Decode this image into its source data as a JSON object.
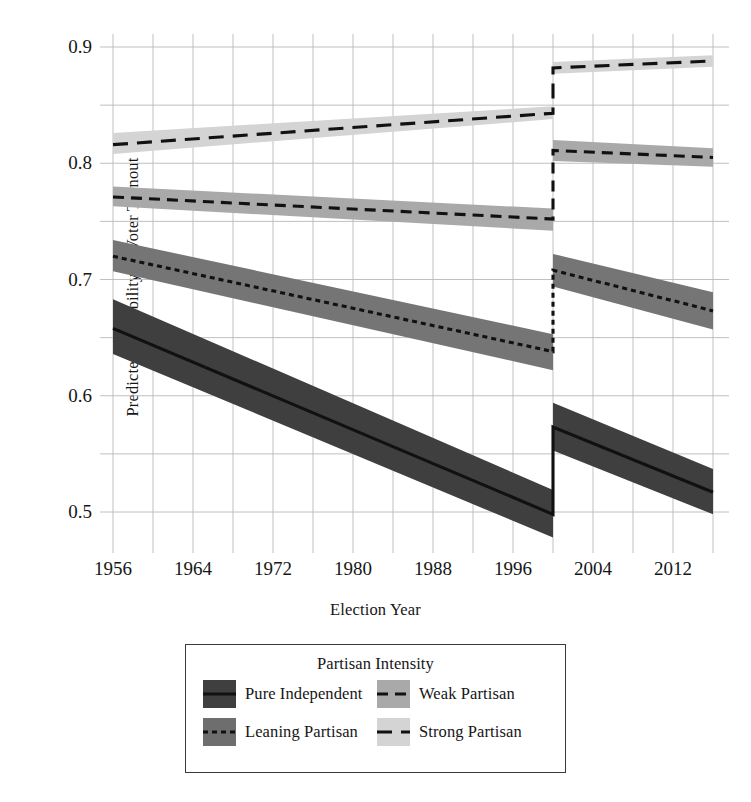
{
  "chart_data": {
    "type": "line",
    "title": "",
    "xlabel": "Election Year",
    "ylabel": "Predicted Probability of Voter Turnout",
    "xlim": [
      1956,
      2016
    ],
    "ylim": [
      0.47,
      0.905
    ],
    "grid": true,
    "x_ticks": [
      "1956",
      "1964",
      "1972",
      "1980",
      "1988",
      "1996",
      "2004",
      "2012"
    ],
    "x_tick_values": [
      1956,
      1964,
      1972,
      1980,
      1988,
      1996,
      2004,
      2012
    ],
    "x_minor_gridlines": [
      1956,
      1960,
      1964,
      1968,
      1972,
      1976,
      1980,
      1984,
      1988,
      1992,
      1996,
      2000,
      2004,
      2008,
      2012,
      2016
    ],
    "y_ticks": [
      "0.9",
      "0.8",
      "0.7",
      "0.6",
      "0.5"
    ],
    "y_tick_values": [
      0.9,
      0.8,
      0.7,
      0.6,
      0.5
    ],
    "y_minor_gridlines": [
      0.85,
      0.75,
      0.65,
      0.55
    ],
    "discontinuity_year": 2000,
    "legend_position": "below-center",
    "legend_title": "Partisan Intensity",
    "series": [
      {
        "name": "Pure Independent",
        "line_style": "solid",
        "band_color": "#3f3f3f",
        "swatch_color": "#3f3f3f",
        "x": [
          1956,
          2000,
          2000,
          2016
        ],
        "values": [
          0.658,
          0.498,
          0.573,
          0.517
        ],
        "ci_lower": [
          0.636,
          0.478,
          0.553,
          0.498
        ],
        "ci_upper": [
          0.683,
          0.519,
          0.594,
          0.537
        ]
      },
      {
        "name": "Leaning Partisan",
        "line_style": "dotted",
        "band_color": "#757575",
        "swatch_color": "#6e6e6e",
        "x": [
          1956,
          2000,
          2000,
          2016
        ],
        "values": [
          0.72,
          0.638,
          0.708,
          0.673
        ],
        "ci_lower": [
          0.707,
          0.622,
          0.694,
          0.657
        ],
        "ci_upper": [
          0.734,
          0.653,
          0.722,
          0.689
        ]
      },
      {
        "name": "Weak Partisan",
        "line_style": "dashed-short",
        "band_color": "#a9a9a9",
        "swatch_color": "#a9a9a9",
        "x": [
          1956,
          2000,
          2000,
          2016
        ],
        "values": [
          0.771,
          0.752,
          0.811,
          0.805
        ],
        "ci_lower": [
          0.763,
          0.742,
          0.802,
          0.797
        ],
        "ci_upper": [
          0.78,
          0.761,
          0.82,
          0.813
        ]
      },
      {
        "name": "Strong Partisan",
        "line_style": "dashed-long",
        "band_color": "#d4d4d4",
        "swatch_color": "#d4d4d4",
        "x": [
          1956,
          2000,
          2000,
          2016
        ],
        "values": [
          0.816,
          0.843,
          0.882,
          0.888
        ],
        "ci_lower": [
          0.808,
          0.838,
          0.877,
          0.883
        ],
        "ci_upper": [
          0.826,
          0.849,
          0.887,
          0.893
        ]
      }
    ]
  },
  "axes": {
    "y_title": "Predicted Probability of Voter Turnout",
    "x_title": "Election Year",
    "y_tick_labels": [
      "0.9",
      "0.8",
      "0.7",
      "0.6",
      "0.5"
    ],
    "x_tick_labels": [
      "1956",
      "1964",
      "1972",
      "1980",
      "1988",
      "1996",
      "2004",
      "2012"
    ]
  },
  "legend": {
    "title": "Partisan Intensity",
    "entries": [
      {
        "label": "Pure Independent",
        "swatch": "#3f3f3f",
        "style": "solid"
      },
      {
        "label": "Weak Partisan",
        "swatch": "#a9a9a9",
        "style": "dashed-short"
      },
      {
        "label": "Leaning Partisan",
        "swatch": "#6e6e6e",
        "style": "dotted"
      },
      {
        "label": "Strong Partisan",
        "swatch": "#d4d4d4",
        "style": "dashed-long"
      }
    ]
  },
  "colors": {
    "grid": "#b9b9b9",
    "line": "#111111",
    "background": "#ffffff",
    "legend_border": "#3a3a3a"
  }
}
